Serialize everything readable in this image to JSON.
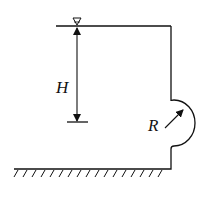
{
  "diagram": {
    "type": "hydrostatics-tank-with-hemispherical-cap",
    "labels": {
      "depth": "H",
      "radius": "R"
    },
    "symbols": {
      "free_surface": "water-surface-triangle-icon",
      "ground": "ground-hatching"
    },
    "colors": {
      "stroke": "#111111",
      "background": "#ffffff"
    }
  }
}
